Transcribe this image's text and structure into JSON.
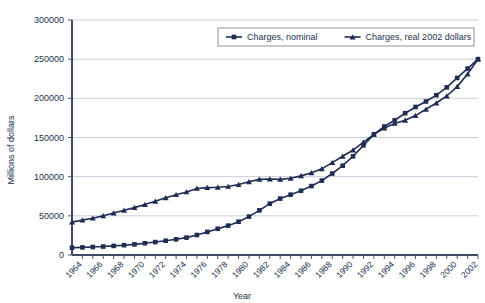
{
  "chart_data": {
    "type": "line",
    "title": "",
    "xlabel": "Year",
    "ylabel": "Millions of dollars",
    "xlim": [
      1963,
      2002
    ],
    "ylim": [
      0,
      300000
    ],
    "ytick_values": [
      0,
      50000,
      100000,
      150000,
      200000,
      250000,
      300000
    ],
    "ytick_labels": [
      "0",
      "50000",
      "100000",
      "150000",
      "200000",
      "250000",
      "300000"
    ],
    "xtick_labels": [
      "1964",
      "1966",
      "1968",
      "1970",
      "1972",
      "1974",
      "1976",
      "1978",
      "1980",
      "1982",
      "1984",
      "1986",
      "1988",
      "1990",
      "1992",
      "1994",
      "1996",
      "1998",
      "2000",
      "2002"
    ],
    "grid": true,
    "legend_position": "top-center",
    "x": [
      1963,
      1964,
      1965,
      1966,
      1967,
      1968,
      1969,
      1970,
      1971,
      1972,
      1973,
      1974,
      1975,
      1976,
      1977,
      1978,
      1979,
      1980,
      1981,
      1982,
      1983,
      1984,
      1985,
      1986,
      1987,
      1988,
      1989,
      1990,
      1991,
      1992,
      1993,
      1994,
      1995,
      1996,
      1997,
      1998,
      1999,
      2000,
      2001,
      2002
    ],
    "series": [
      {
        "name": "Charges, nominal",
        "marker": "square",
        "color": "#1f2d54",
        "values": [
          9300,
          9700,
          10200,
          10800,
          11600,
          12500,
          13600,
          15000,
          16500,
          18200,
          20000,
          22200,
          25500,
          29500,
          33500,
          37500,
          42500,
          49000,
          57000,
          65500,
          72000,
          77000,
          82000,
          88000,
          95000,
          104000,
          114000,
          126000,
          140000,
          154000,
          164000,
          172000,
          181000,
          189000,
          196000,
          204000,
          214000,
          226000,
          238000,
          250000
        ]
      },
      {
        "name": "Charges, real 2002 dollars",
        "marker": "triangle",
        "color": "#1f2d54",
        "values": [
          42000,
          44500,
          47000,
          50000,
          53500,
          57000,
          60500,
          64500,
          68500,
          73000,
          77000,
          80500,
          85000,
          86000,
          86500,
          87500,
          90000,
          93500,
          96500,
          97000,
          96500,
          98000,
          101000,
          105000,
          110000,
          118000,
          126000,
          134000,
          144000,
          154000,
          162000,
          168000,
          172000,
          178000,
          186000,
          194000,
          203000,
          215000,
          231000,
          250000
        ]
      }
    ]
  }
}
